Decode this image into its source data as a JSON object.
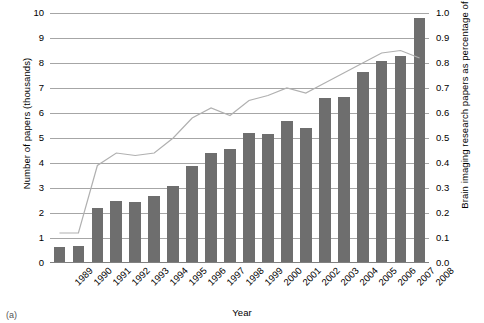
{
  "figure": {
    "caption": "(a)"
  },
  "axes": {
    "xlabel": "Year",
    "ylabel_left": "Number of papers (thousands)",
    "ylabel_right": "Brain imaging research papers as percentage of global research (line)",
    "left_ticks": [
      "10",
      "9",
      "8",
      "7",
      "6",
      "5",
      "4",
      "3",
      "2",
      "1",
      "0"
    ],
    "right_ticks": [
      "1.0",
      "0.9",
      "0.8",
      "0.7",
      "0.6",
      "0.5",
      "0.4",
      "0.3",
      "0.2",
      "0.1",
      "0.0"
    ]
  },
  "style": {
    "bar_color": "#6e6e6e",
    "line_color": "#b0b0b0",
    "grid_color": "#a6a6a6",
    "text_color": "#000000",
    "background": "#ffffff"
  },
  "chart_data": {
    "type": "bar",
    "title": "",
    "subtitle": "",
    "xlabel": "Year",
    "ylabel": "Number of papers (thousands)",
    "ylabel_secondary": "Brain imaging research papers as percentage of global research (line)",
    "grid": true,
    "legend": "none",
    "ylim": [
      0,
      10
    ],
    "ylim_secondary": [
      0.0,
      1.0
    ],
    "categories": [
      "1989",
      "1990",
      "1991",
      "1992",
      "1993",
      "1994",
      "1995",
      "1996",
      "1997",
      "1998",
      "1999",
      "2000",
      "2001",
      "2002",
      "2003",
      "2004",
      "2005",
      "2006",
      "2007",
      "2008"
    ],
    "series": [
      {
        "name": "Number of papers (thousands)",
        "type": "bar",
        "axis": "left",
        "values": [
          0.65,
          0.67,
          2.2,
          2.5,
          2.45,
          2.7,
          3.1,
          3.9,
          4.4,
          4.55,
          5.2,
          5.15,
          5.7,
          5.4,
          6.6,
          6.65,
          7.65,
          8.1,
          8.3,
          9.8
        ]
      },
      {
        "name": "Brain imaging research papers as percentage of global research (line)",
        "type": "line",
        "axis": "right",
        "values": [
          0.12,
          0.12,
          0.39,
          0.44,
          0.43,
          0.44,
          0.5,
          0.58,
          0.62,
          0.59,
          0.65,
          0.67,
          0.7,
          0.68,
          0.72,
          0.76,
          0.8,
          0.84,
          0.85,
          0.82
        ]
      }
    ]
  }
}
